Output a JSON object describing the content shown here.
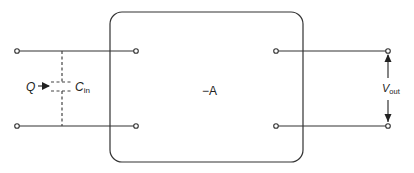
{
  "diagram": {
    "block_label": "−A",
    "input_charge_label": "Q",
    "input_capacitance": {
      "symbol": "C",
      "subscript": "in"
    },
    "output_voltage": {
      "symbol": "V",
      "subscript": "out"
    },
    "colors": {
      "stroke": "#333333",
      "background": "#ffffff"
    }
  }
}
